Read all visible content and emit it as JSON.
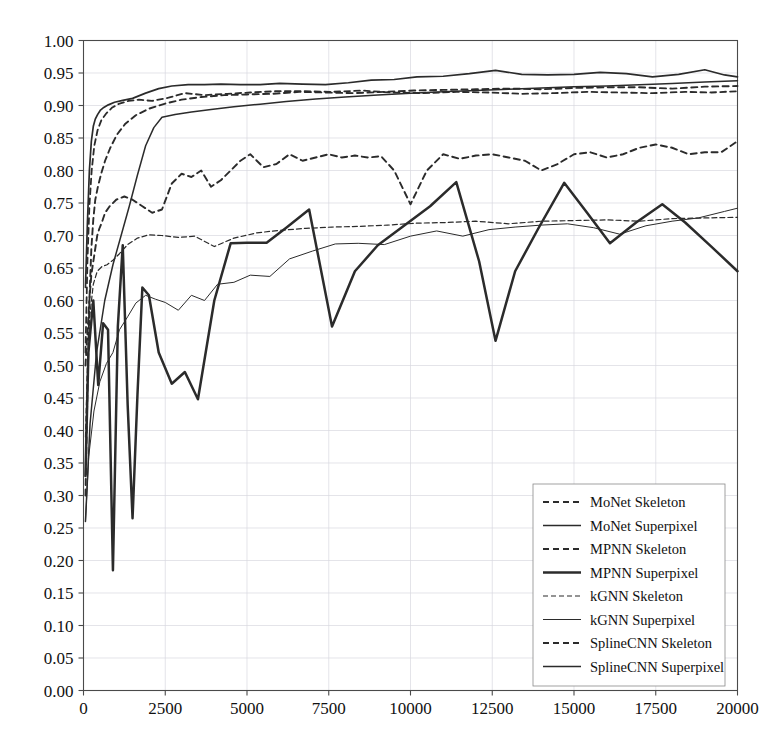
{
  "chart_data": {
    "type": "line",
    "title": "",
    "xlabel": "",
    "ylabel": "",
    "xlim": [
      0,
      20000
    ],
    "ylim": [
      0.0,
      1.0
    ],
    "grid": true,
    "legend_position": "lower right",
    "xticks": [
      0,
      2500,
      5000,
      7500,
      10000,
      12500,
      15000,
      17500,
      20000
    ],
    "xtick_labels": [
      "0",
      "2500",
      "5000",
      "7500",
      "10000",
      "12500",
      "15000",
      "17500",
      "20000"
    ],
    "yticks": [
      0.0,
      0.05,
      0.1,
      0.15,
      0.2,
      0.25,
      0.3,
      0.35,
      0.4,
      0.45,
      0.5,
      0.55,
      0.6,
      0.65,
      0.7,
      0.75,
      0.8,
      0.85,
      0.9,
      0.95,
      1.0
    ],
    "ytick_labels": [
      "0.00",
      "0.05",
      "0.10",
      "0.15",
      "0.20",
      "0.25",
      "0.30",
      "0.35",
      "0.40",
      "0.45",
      "0.50",
      "0.55",
      "0.60",
      "0.65",
      "0.70",
      "0.75",
      "0.80",
      "0.85",
      "0.90",
      "0.95",
      "1.00"
    ],
    "series": [
      {
        "name": "MoNet Skeleton",
        "style": "dashed",
        "width": 1.9,
        "color": "#2b2b2b",
        "x": [
          60,
          120,
          180,
          240,
          300,
          360,
          420,
          480,
          560,
          660,
          800,
          1000,
          1250,
          1500,
          1800,
          2100,
          2400,
          2700,
          3000,
          3300,
          3600,
          3900,
          4200,
          4500,
          4800,
          5100,
          5500,
          5900,
          6300,
          6700,
          7100,
          7500,
          7900,
          8300,
          8700,
          9100,
          9500,
          10000,
          10500,
          11000,
          11500,
          12000,
          12500,
          13000,
          13500,
          14000,
          14500,
          15000,
          15500,
          16000,
          16500,
          17000,
          17500,
          18000,
          18500,
          19000,
          19500,
          20000
        ],
        "y": [
          0.5,
          0.55,
          0.6,
          0.64,
          0.66,
          0.68,
          0.7,
          0.71,
          0.72,
          0.735,
          0.745,
          0.755,
          0.76,
          0.755,
          0.745,
          0.735,
          0.74,
          0.78,
          0.795,
          0.79,
          0.8,
          0.775,
          0.785,
          0.8,
          0.815,
          0.825,
          0.805,
          0.81,
          0.825,
          0.815,
          0.82,
          0.825,
          0.82,
          0.823,
          0.82,
          0.822,
          0.8,
          0.748,
          0.8,
          0.825,
          0.818,
          0.823,
          0.825,
          0.82,
          0.815,
          0.8,
          0.81,
          0.825,
          0.828,
          0.82,
          0.825,
          0.835,
          0.84,
          0.835,
          0.825,
          0.828,
          0.828,
          0.845
        ]
      },
      {
        "name": "MoNet Superpixel",
        "style": "solid",
        "width": 1.7,
        "color": "#2b2b2b",
        "x": [
          60,
          120,
          180,
          240,
          300,
          360,
          430,
          520,
          620,
          760,
          950,
          1200,
          1500,
          1900,
          2300,
          2700,
          3200,
          3700,
          4200,
          4800,
          5400,
          6000,
          6700,
          7400,
          8100,
          8800,
          9500,
          10200,
          11000,
          11800,
          12600,
          13400,
          14200,
          15000,
          15800,
          16600,
          17400,
          18200,
          19000,
          19600,
          20000
        ],
        "y": [
          0.62,
          0.72,
          0.8,
          0.845,
          0.868,
          0.879,
          0.886,
          0.893,
          0.897,
          0.901,
          0.905,
          0.908,
          0.911,
          0.919,
          0.926,
          0.93,
          0.932,
          0.932,
          0.933,
          0.932,
          0.932,
          0.934,
          0.933,
          0.932,
          0.935,
          0.939,
          0.94,
          0.944,
          0.945,
          0.949,
          0.954,
          0.948,
          0.947,
          0.948,
          0.951,
          0.949,
          0.944,
          0.948,
          0.955,
          0.947,
          0.944
        ]
      },
      {
        "name": "MPNN Skeleton",
        "style": "dashed",
        "width": 1.9,
        "color": "#2b2b2b",
        "x": [
          60,
          120,
          180,
          240,
          300,
          360,
          440,
          540,
          660,
          820,
          1020,
          1280,
          1600,
          2000,
          2500,
          3000,
          3600,
          4300,
          5000,
          5800,
          6600,
          7400,
          8300,
          9200,
          10100,
          11000,
          12000,
          13000,
          14000,
          15000,
          16000,
          17000,
          18000,
          19000,
          20000
        ],
        "y": [
          0.3,
          0.46,
          0.6,
          0.68,
          0.725,
          0.755,
          0.775,
          0.795,
          0.815,
          0.835,
          0.855,
          0.872,
          0.885,
          0.895,
          0.903,
          0.909,
          0.913,
          0.916,
          0.917,
          0.918,
          0.921,
          0.92,
          0.919,
          0.921,
          0.923,
          0.924,
          0.925,
          0.926,
          0.925,
          0.927,
          0.928,
          0.928,
          0.926,
          0.929,
          0.93
        ]
      },
      {
        "name": "MPNN Superpixel",
        "style": "solid",
        "width": 2.5,
        "color": "#2b2b2b",
        "x": [
          60,
          150,
          300,
          450,
          600,
          750,
          900,
          1050,
          1200,
          1350,
          1500,
          1650,
          1800,
          2000,
          2300,
          2700,
          3100,
          3500,
          4000,
          4500,
          5000,
          5600,
          6200,
          6900,
          7600,
          8300,
          9000,
          9800,
          10600,
          11400,
          12100,
          12600,
          13200,
          13900,
          14700,
          15400,
          16100,
          16900,
          17700,
          18400,
          19200,
          20000
        ],
        "y": [
          0.33,
          0.52,
          0.6,
          0.47,
          0.565,
          0.555,
          0.185,
          0.56,
          0.685,
          0.44,
          0.265,
          0.455,
          0.62,
          0.608,
          0.52,
          0.472,
          0.49,
          0.448,
          0.6,
          0.688,
          0.689,
          0.689,
          0.712,
          0.74,
          0.56,
          0.645,
          0.685,
          0.715,
          0.745,
          0.782,
          0.66,
          0.538,
          0.645,
          0.71,
          0.781,
          0.735,
          0.688,
          0.72,
          0.748,
          0.72,
          0.683,
          0.645
        ]
      },
      {
        "name": "kGNN Skeleton",
        "style": "dashed",
        "width": 1.2,
        "color": "#555555",
        "x": [
          60,
          120,
          200,
          300,
          420,
          560,
          720,
          900,
          1100,
          1350,
          1650,
          2000,
          2400,
          2900,
          3400,
          4000,
          4600,
          5300,
          6000,
          6800,
          7600,
          8400,
          9300,
          10200,
          11100,
          12000,
          13000,
          14000,
          15000,
          16000,
          17000,
          18000,
          19000,
          20000
        ],
        "y": [
          0.39,
          0.5,
          0.58,
          0.625,
          0.645,
          0.652,
          0.655,
          0.662,
          0.672,
          0.686,
          0.696,
          0.701,
          0.7,
          0.697,
          0.699,
          0.683,
          0.696,
          0.704,
          0.708,
          0.711,
          0.713,
          0.714,
          0.716,
          0.719,
          0.72,
          0.722,
          0.718,
          0.722,
          0.723,
          0.724,
          0.722,
          0.726,
          0.727,
          0.728
        ]
      },
      {
        "name": "kGNN Superpixel",
        "style": "solid",
        "width": 1.0,
        "color": "#555555",
        "x": [
          60,
          160,
          320,
          500,
          700,
          900,
          1100,
          1350,
          1600,
          1900,
          2200,
          2500,
          2900,
          3300,
          3700,
          4100,
          4600,
          5100,
          5700,
          6300,
          7000,
          7700,
          8400,
          9200,
          10000,
          10800,
          11600,
          12400,
          13200,
          14000,
          14800,
          15600,
          16400,
          17200,
          18000,
          18800,
          19600,
          20000
        ],
        "y": [
          0.26,
          0.36,
          0.43,
          0.475,
          0.503,
          0.52,
          0.555,
          0.575,
          0.596,
          0.608,
          0.602,
          0.597,
          0.585,
          0.608,
          0.6,
          0.625,
          0.628,
          0.639,
          0.637,
          0.664,
          0.676,
          0.687,
          0.688,
          0.686,
          0.699,
          0.707,
          0.699,
          0.709,
          0.713,
          0.716,
          0.718,
          0.712,
          0.702,
          0.715,
          0.722,
          0.727,
          0.737,
          0.742
        ]
      },
      {
        "name": "SplineCNN Skeleton",
        "style": "dashed",
        "width": 1.8,
        "color": "#2b2b2b",
        "x": [
          60,
          120,
          180,
          250,
          330,
          430,
          550,
          700,
          880,
          1100,
          1380,
          1700,
          2100,
          2600,
          3100,
          3700,
          4400,
          5100,
          5900,
          6700,
          7600,
          8500,
          9400,
          10400,
          11400,
          12400,
          13400,
          14400,
          15400,
          16400,
          17400,
          18400,
          19200,
          20000
        ],
        "y": [
          0.52,
          0.66,
          0.745,
          0.8,
          0.838,
          0.862,
          0.878,
          0.888,
          0.897,
          0.903,
          0.907,
          0.909,
          0.907,
          0.912,
          0.919,
          0.916,
          0.918,
          0.92,
          0.922,
          0.922,
          0.921,
          0.923,
          0.92,
          0.919,
          0.921,
          0.92,
          0.918,
          0.919,
          0.921,
          0.92,
          0.919,
          0.921,
          0.92,
          0.922
        ]
      },
      {
        "name": "SplineCNN Superpixel",
        "style": "solid",
        "width": 1.5,
        "color": "#2b2b2b",
        "x": [
          60,
          200,
          400,
          650,
          900,
          1150,
          1400,
          1650,
          1900,
          2150,
          2400,
          2800,
          3300,
          3900,
          4600,
          5400,
          6200,
          7100,
          8000,
          9000,
          10000,
          11000,
          12000,
          13000,
          14000,
          15000,
          16000,
          17000,
          18000,
          19000,
          20000
        ],
        "y": [
          0.26,
          0.41,
          0.52,
          0.6,
          0.655,
          0.7,
          0.745,
          0.793,
          0.838,
          0.866,
          0.882,
          0.886,
          0.89,
          0.894,
          0.898,
          0.902,
          0.906,
          0.91,
          0.913,
          0.916,
          0.919,
          0.921,
          0.923,
          0.925,
          0.927,
          0.929,
          0.93,
          0.932,
          0.934,
          0.936,
          0.938
        ]
      }
    ]
  },
  "legend": {
    "items": [
      {
        "label": "MoNet Skeleton",
        "style": "dashed"
      },
      {
        "label": "MoNet Superpixel",
        "style": "solid"
      },
      {
        "label": "MPNN Skeleton",
        "style": "dashed"
      },
      {
        "label": "MPNN Superpixel",
        "style": "solid"
      },
      {
        "label": "kGNN Skeleton",
        "style": "dashed"
      },
      {
        "label": "kGNN Superpixel",
        "style": "solid"
      },
      {
        "label": "SplineCNN Skeleton",
        "style": "dashed"
      },
      {
        "label": "SplineCNN Superpixel",
        "style": "solid"
      }
    ]
  }
}
